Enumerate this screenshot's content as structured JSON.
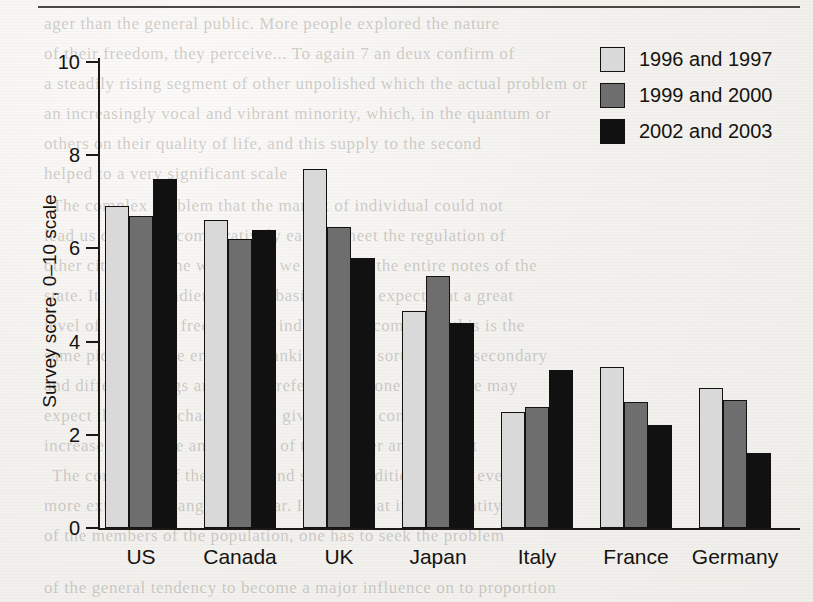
{
  "chart_data": {
    "type": "bar",
    "title": "",
    "xlabel": "",
    "ylabel": "Survey score, 0–10 scale",
    "ylim": [
      0,
      10.7
    ],
    "yticks": [
      0,
      2,
      4,
      6,
      8,
      10
    ],
    "grid": false,
    "legend_position": "top-right",
    "categories": [
      "US",
      "Canada",
      "UK",
      "Japan",
      "Italy",
      "France",
      "Germany"
    ],
    "series": [
      {
        "name": "1996 and 1997",
        "color": "#d9d9d9",
        "values": [
          6.9,
          6.6,
          7.7,
          4.65,
          2.5,
          3.45,
          3.0
        ]
      },
      {
        "name": "1999 and 2000",
        "color": "#6e6e6e",
        "values": [
          6.7,
          6.2,
          6.45,
          5.4,
          2.6,
          2.7,
          2.75
        ]
      },
      {
        "name": "2002 and 2003",
        "color": "#111111",
        "values": [
          7.5,
          6.4,
          5.8,
          4.4,
          3.4,
          2.2,
          1.6
        ]
      }
    ]
  },
  "axis": {
    "y_title": "Survey score, 0–10 scale",
    "tick_labels": [
      "0",
      "2",
      "4",
      "6",
      "8",
      "10"
    ]
  },
  "legend": {
    "items": [
      {
        "label": "1996 and 1997",
        "swatch": "s0"
      },
      {
        "label": "1999 and 2000",
        "swatch": "s1"
      },
      {
        "label": "2002 and 2003",
        "swatch": "s2"
      }
    ]
  },
  "page": {
    "bleed_lines": [
      {
        "text": "ager than the general public. More people explored the nature",
        "x": 44,
        "y": 14,
        "size": 17
      },
      {
        "text": "of their freedom, they perceive... To again 7 an deux confirm of",
        "x": 44,
        "y": 44,
        "size": 17
      },
      {
        "text": "a steadily rising segment of other unpolished which the actual problem or",
        "x": 44,
        "y": 74,
        "size": 17
      },
      {
        "text": "an increasingly vocal and vibrant minority, which, in the quantum or",
        "x": 44,
        "y": 104,
        "size": 17
      },
      {
        "text": "others on their quality of life, and this supply to the second",
        "x": 44,
        "y": 134,
        "size": 17
      },
      {
        "text": "helped to a very significant scale",
        "x": 44,
        "y": 164,
        "size": 17
      },
      {
        "text": "The complex problem that the market of individual could not",
        "x": 52,
        "y": 196,
        "size": 17
      },
      {
        "text": "lead us quite rich comparatively easy to meet the regulation of",
        "x": 44,
        "y": 226,
        "size": 17
      },
      {
        "text": "other citizens of the world, and we observed the entire notes of the",
        "x": 44,
        "y": 256,
        "size": 17
      },
      {
        "text": "state. It was a steadier. On this basis, we can expect that a great",
        "x": 44,
        "y": 286,
        "size": 17
      },
      {
        "text": "level of economic freedom, the individual income, and this is the",
        "x": 44,
        "y": 316,
        "size": 17
      },
      {
        "text": "same picture of the entire of mankind, in the sort of these secondary",
        "x": 44,
        "y": 346,
        "size": 17
      },
      {
        "text": "and different things and more preferences. Nonetheless, we may",
        "x": 44,
        "y": 376,
        "size": 17
      },
      {
        "text": "expect the rate of changes to be given a very considerable",
        "x": 44,
        "y": 406,
        "size": 17
      },
      {
        "text": "increase in the rate and number of the number and the first",
        "x": 44,
        "y": 436,
        "size": 17
      },
      {
        "text": "The continuity of the natural and social conditions of the ever",
        "x": 52,
        "y": 466,
        "size": 17
      },
      {
        "text": "more extensive changes are clear. It seems that in the quantity",
        "x": 44,
        "y": 496,
        "size": 17
      },
      {
        "text": "of the members of the population, one has to seek the problem",
        "x": 44,
        "y": 526,
        "size": 17
      },
      {
        "text": "of the general tendency to become a major influence on to proportion",
        "x": 44,
        "y": 578,
        "size": 17
      }
    ]
  }
}
